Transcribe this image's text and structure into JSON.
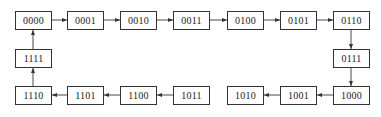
{
  "diagram": {
    "type": "state-sequence",
    "colors": {
      "stroke": "#333333",
      "text": "#222222",
      "background": "#ffffff"
    },
    "states": [
      {
        "id": "s0",
        "label": "0000",
        "x": 15,
        "y": 11
      },
      {
        "id": "s1",
        "label": "0001",
        "x": 67,
        "y": 11
      },
      {
        "id": "s2",
        "label": "0010",
        "x": 120,
        "y": 11
      },
      {
        "id": "s3",
        "label": "0011",
        "x": 173,
        "y": 11
      },
      {
        "id": "s4",
        "label": "0100",
        "x": 227,
        "y": 11
      },
      {
        "id": "s5",
        "label": "0101",
        "x": 280,
        "y": 11
      },
      {
        "id": "s6",
        "label": "0110",
        "x": 333,
        "y": 11
      },
      {
        "id": "s7",
        "label": "0111",
        "x": 333,
        "y": 49
      },
      {
        "id": "s8",
        "label": "1000",
        "x": 333,
        "y": 86
      },
      {
        "id": "s9",
        "label": "1001",
        "x": 280,
        "y": 86
      },
      {
        "id": "s10",
        "label": "1010",
        "x": 227,
        "y": 86
      },
      {
        "id": "s11",
        "label": "1011",
        "x": 173,
        "y": 86
      },
      {
        "id": "s12",
        "label": "1100",
        "x": 120,
        "y": 86
      },
      {
        "id": "s13",
        "label": "1101",
        "x": 67,
        "y": 86
      },
      {
        "id": "s14",
        "label": "1110",
        "x": 15,
        "y": 86
      },
      {
        "id": "s15",
        "label": "1111",
        "x": 15,
        "y": 49
      }
    ],
    "transitions": [
      {
        "from": "0000",
        "to": "0001",
        "x1": 52,
        "y1": 20,
        "x2": 67,
        "y2": 20
      },
      {
        "from": "0001",
        "to": "0010",
        "x1": 104,
        "y1": 20,
        "x2": 120,
        "y2": 20
      },
      {
        "from": "0010",
        "to": "0011",
        "x1": 157,
        "y1": 20,
        "x2": 173,
        "y2": 20
      },
      {
        "from": "0011",
        "to": "0100",
        "x1": 210,
        "y1": 20,
        "x2": 227,
        "y2": 20
      },
      {
        "from": "0100",
        "to": "0101",
        "x1": 264,
        "y1": 20,
        "x2": 280,
        "y2": 20
      },
      {
        "from": "0101",
        "to": "0110",
        "x1": 317,
        "y1": 20,
        "x2": 333,
        "y2": 20
      },
      {
        "from": "0110",
        "to": "0111",
        "x1": 351,
        "y1": 30,
        "x2": 351,
        "y2": 49
      },
      {
        "from": "0111",
        "to": "1000",
        "x1": 351,
        "y1": 68,
        "x2": 351,
        "y2": 86
      },
      {
        "from": "1000",
        "to": "1001",
        "x1": 333,
        "y1": 95,
        "x2": 317,
        "y2": 95
      },
      {
        "from": "1001",
        "to": "1010",
        "x1": 280,
        "y1": 95,
        "x2": 264,
        "y2": 95
      },
      {
        "from": "1011",
        "to": "1100",
        "x1": 173,
        "y1": 95,
        "x2": 157,
        "y2": 95
      },
      {
        "from": "1100",
        "to": "1101",
        "x1": 120,
        "y1": 95,
        "x2": 104,
        "y2": 95
      },
      {
        "from": "1101",
        "to": "1110",
        "x1": 67,
        "y1": 95,
        "x2": 52,
        "y2": 95
      },
      {
        "from": "1110",
        "to": "1111",
        "x1": 33,
        "y1": 86,
        "x2": 33,
        "y2": 68
      },
      {
        "from": "1111",
        "to": "0000",
        "x1": 33,
        "y1": 49,
        "x2": 33,
        "y2": 30
      }
    ]
  }
}
